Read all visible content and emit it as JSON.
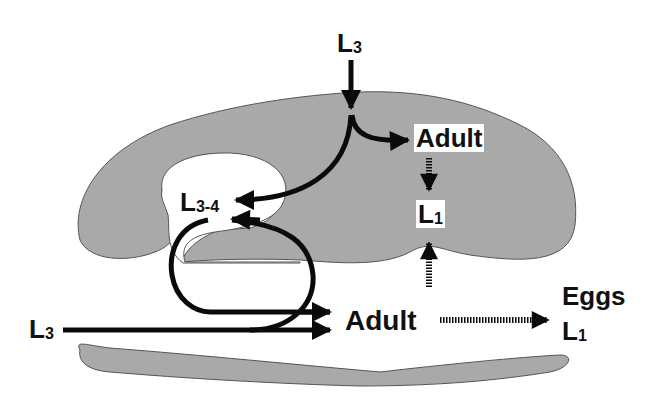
{
  "diagram": {
    "type": "life-cycle",
    "colors": {
      "tissue_fill": "#a9a9a9",
      "tissue_stroke": "#555555",
      "arrow": "#0a0a0a",
      "background": "#ffffff"
    },
    "labels": {
      "top_l3": {
        "main": "L",
        "sub": "3"
      },
      "adult_upper": {
        "text": "Adult"
      },
      "l1_upper": {
        "main": "L",
        "sub": "1"
      },
      "l34": {
        "main": "L",
        "sub": "3-4"
      },
      "left_l3": {
        "main": "L",
        "sub": "3"
      },
      "adult_lower": {
        "text": "Adult"
      },
      "eggs": {
        "text": "Eggs"
      },
      "l1_lower": {
        "main": "L",
        "sub": "1"
      }
    },
    "arrows": [
      {
        "from": "top_l3",
        "to": "tissue_entry",
        "style": "solid"
      },
      {
        "from": "tissue_entry",
        "to": "adult_upper",
        "style": "solid"
      },
      {
        "from": "tissue_entry",
        "to": "l34",
        "style": "solid"
      },
      {
        "from": "adult_upper",
        "to": "l1_upper",
        "style": "dashed"
      },
      {
        "from": "lumen",
        "to": "l1_upper",
        "style": "dashed"
      },
      {
        "from": "loop",
        "to": "l34",
        "style": "solid"
      },
      {
        "from": "l34",
        "to": "adult_lower",
        "style": "solid"
      },
      {
        "from": "left_l3",
        "to": "adult_lower",
        "style": "solid"
      },
      {
        "from": "adult_lower",
        "to": "eggs",
        "style": "dashed"
      }
    ]
  }
}
